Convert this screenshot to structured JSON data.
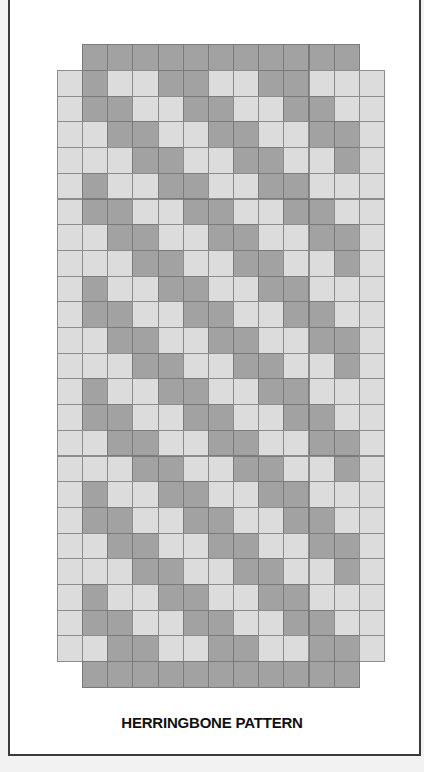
{
  "figure": {
    "caption": "HERRINGBONE PATTERN",
    "colors": {
      "light_cell": "#dcdcdc",
      "dark_cell": "#a2a2a2",
      "grid_line": "#8c8c8c",
      "frame": "#3a3a3a",
      "background": "#ffffff"
    },
    "grid": {
      "columns": 13,
      "body_rows": 23,
      "origin_x": 57,
      "origin_y": 70,
      "cell_width": 25.15,
      "cell_height": 25.7,
      "cap_rows": {
        "top": {
          "y": 44,
          "height": 26,
          "first_col": 1,
          "last_col": 11,
          "shade": "dark"
        },
        "bottom": {
          "y": 661,
          "height": 26,
          "first_col": 1,
          "last_col": 11,
          "shade": "dark"
        }
      },
      "edge_columns_light": [
        0,
        12
      ],
      "row_patterns": [
        [
          0,
          1,
          0,
          0,
          1,
          1,
          0,
          0,
          1,
          1,
          0,
          0,
          0
        ],
        [
          0,
          1,
          1,
          0,
          0,
          1,
          1,
          0,
          0,
          1,
          1,
          0,
          0
        ],
        [
          0,
          0,
          1,
          1,
          0,
          0,
          1,
          1,
          0,
          0,
          1,
          1,
          0
        ],
        [
          0,
          0,
          0,
          1,
          1,
          0,
          0,
          1,
          1,
          0,
          0,
          1,
          0
        ]
      ],
      "pattern_rule": "row r uses row_patterns[r mod 4]; 1 = dark, 0 = light"
    }
  }
}
